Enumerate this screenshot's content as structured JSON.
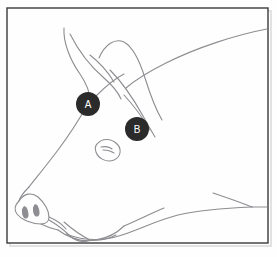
{
  "figure": {
    "background_color": "#fefefe",
    "frame": {
      "name": "image-border",
      "stroke_color": "#3a3a3a",
      "stroke_width": 1.4,
      "x": 7,
      "y": 8,
      "width": 261,
      "height": 235
    },
    "drawing": {
      "stroke_color": "#8d8d92",
      "stroke_width": 1.1,
      "fill": "none"
    },
    "shadow": {
      "name": "paper-shadow",
      "color": "#d9d9d9",
      "visible": true
    }
  },
  "markers": [
    {
      "id": "marker-a",
      "label": "A",
      "cx": 88,
      "cy": 104,
      "r": 12,
      "fill": "#2b2b2b",
      "text_color": "#ffffff",
      "anatomy": "forehead-brow-ridge"
    },
    {
      "id": "marker-b",
      "label": "B",
      "cx": 137,
      "cy": 129,
      "r": 12,
      "fill": "#2b2b2b",
      "text_color": "#ffffff",
      "anatomy": "behind-eye-below-ear"
    }
  ],
  "paths": {
    "back_neck_line": "M 267 29 C 235 35 196 48 166 63 C 146 73 134 81 126 88",
    "front_ear": "M 64 28 C 63 42 70 60 80 74 C 86 83 90 92 90 100",
    "front_ear_inner": "M 70 34 C 78 50 90 66 104 78 C 112 85 118 92 121 99",
    "ear_crease": "M 90 55 C 99 62 108 72 114 82",
    "second_ear_outer": "M 99 58 C 105 44 115 38 124 42 C 133 47 140 62 145 78 C 150 94 155 108 162 120",
    "second_ear_inner": "M 110 70 C 122 82 133 98 143 116 C 148 125 152 132 155 137",
    "second_ear_tip": "M 124 95 C 134 106 143 118 150 130",
    "face_profile": "M 88 104 C 80 118 70 134 58 150 C 46 166 36 178 29 187",
    "snout_top": "M 29 187 C 24 192 20 197 19 201",
    "snout_disc": "M 19 201 C 15 205 14 210 17 214 C 22 220 32 224 41 224 C 46 224 49 221 49 217 C 49 211 45 203 38 197 C 32 192 24 193 19 201 Z",
    "snout_under": "M 41 224 C 47 227 53 229 58 230",
    "nostril_left": "M 24 207 C 22 209 22 214 24 217 C 26 219 28 218 28 215 C 28 211 26 206 24 207 Z",
    "nostril_right": "M 35 205 C 33 207 33 212 35 215 C 37 217 39 216 39 213 C 39 209 37 204 35 205 Z",
    "cheek_jowl": "M 49 217 C 56 220 62 224 66 229",
    "tusk": "M 49 220 C 56 224 64 230 70 236 C 76 241 83 243 90 240 C 82 236 72 229 64 222",
    "lower_jaw": "M 58 230 C 70 239 84 242 96 240 C 108 238 118 232 124 226",
    "chin_to_chest": "M 66 234 C 84 241 104 241 122 235 C 140 229 158 220 178 215 C 200 210 228 208 252 207",
    "chest_upper": "M 213 193 C 228 198 242 203 252 207",
    "chest_to_frame": "M 252 207 L 267 207",
    "mouth_line": "M 90 240 C 98 241 108 239 116 235",
    "eye": "M 97 144 C 102 138 111 138 117 144 C 122 149 121 157 114 160 C 106 163 98 158 96 152 C 95 149 95 146 97 144 Z",
    "eye_pupil": "M 101 147 C 105 146 110 147 112 149",
    "eye_lash": "M 103 150 C 107 150 111 151 114 153",
    "brow_from_a": "M 96 96 C 106 86 116 78 124 74",
    "jaw_contour": "M 124 226 C 138 220 152 213 164 208"
  }
}
